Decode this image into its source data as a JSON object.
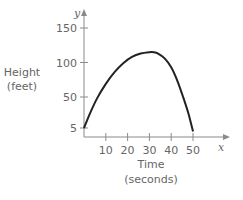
{
  "chart_data": {
    "type": "line",
    "title": "",
    "xlabel": "Time",
    "xlabel_units": "(seconds)",
    "ylabel": "Height",
    "ylabel_units": "(feet)",
    "x_axis_var": "x",
    "y_axis_var": "y",
    "xlim": [
      0,
      60
    ],
    "ylim": [
      0,
      160
    ],
    "x_ticks": [
      10,
      20,
      30,
      40,
      50
    ],
    "x_tick_labels": [
      "10",
      "20",
      "30",
      "40",
      "50"
    ],
    "y_ticks": [
      5,
      50,
      100,
      150
    ],
    "y_tick_labels": [
      "5",
      "50",
      "100",
      "150"
    ],
    "grid": false,
    "legend": "none",
    "series": [
      {
        "name": "height",
        "x": [
          0,
          3,
          6,
          10,
          14,
          18,
          22,
          26,
          30,
          32,
          34,
          37,
          40,
          43,
          46,
          48,
          50
        ],
        "y": [
          5,
          28,
          48,
          69,
          86,
          99,
          108,
          113,
          115,
          115,
          113,
          106,
          93,
          72,
          45,
          25,
          0
        ]
      }
    ]
  }
}
